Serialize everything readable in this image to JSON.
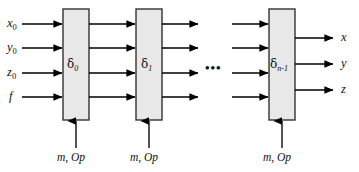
{
  "figure": {
    "type": "block-diagram",
    "background_color": "#ffffff",
    "line_color": "#000000",
    "box_fill_color": "#e8e8e8",
    "box_border_color": "#333333"
  },
  "inputs": [
    {
      "label": "x",
      "sub": "0",
      "name": "input-x0"
    },
    {
      "label": "y",
      "sub": "0",
      "name": "input-y0"
    },
    {
      "label": "z",
      "sub": "0",
      "name": "input-z0"
    },
    {
      "label": "f",
      "sub": "",
      "name": "input-f"
    }
  ],
  "stages": [
    {
      "symbol": "δ",
      "sub": "0",
      "control": "m, Op",
      "name": "stage-delta-0"
    },
    {
      "symbol": "δ",
      "sub": "1",
      "control": "m, Op",
      "name": "stage-delta-1"
    },
    {
      "symbol": "δ",
      "sub": "n-1",
      "control": "m, Op",
      "name": "stage-delta-n-1"
    }
  ],
  "ellipsis": "•••",
  "outputs": [
    {
      "label": "x",
      "name": "output-x"
    },
    {
      "label": "y",
      "name": "output-y"
    },
    {
      "label": "z",
      "name": "output-z"
    }
  ]
}
